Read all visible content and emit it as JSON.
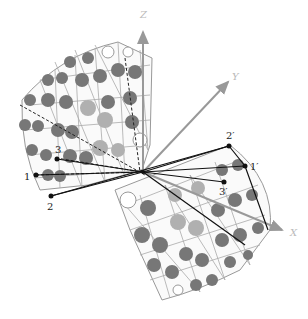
{
  "diagram": {
    "type": "3d-reflection-of-spherical-patch",
    "axes": {
      "z": "Z",
      "y": "Y",
      "x": "X"
    },
    "points": {
      "p1": "1",
      "p2": "2",
      "p3": "3",
      "q1": "1′",
      "q2": "2′",
      "q3": "3′"
    },
    "colors": {
      "grid": "#999999",
      "dark_disc": "#777777",
      "light_disc": "#b0b0b0",
      "axis": "#999999",
      "line": "#111111"
    }
  }
}
